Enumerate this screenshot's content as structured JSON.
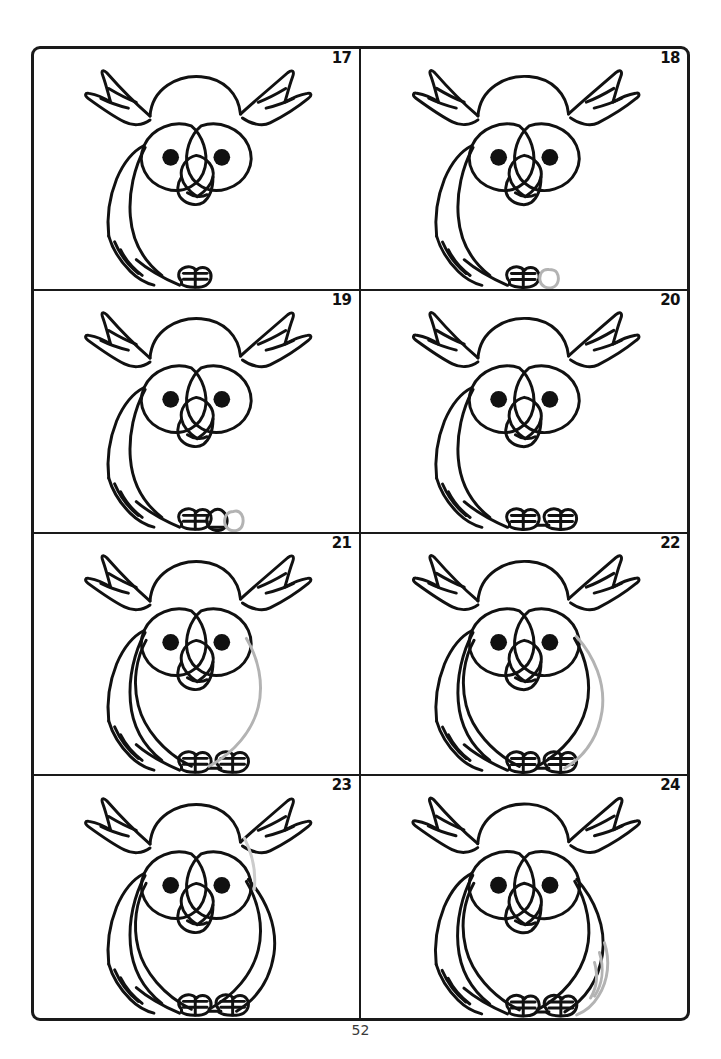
{
  "page": {
    "page_number": "52",
    "sheet_border_color": "#1a1a1a",
    "background_color": "#ffffff",
    "ink_color": "#111111",
    "new_stroke_color": "#b3b3b3"
  },
  "panels": [
    {
      "number": "17",
      "caption": "Owl head with ear tufts, eye discs, pupils, beak, left wing sweep and one toe - all in black ink",
      "new_stroke": "none",
      "features": {
        "head": true,
        "ear_tufts": true,
        "eye_discs": true,
        "pupils": true,
        "beak": true,
        "left_wing": true,
        "left_foot": true,
        "right_foot": false,
        "body": false,
        "right_wing": false
      }
    },
    {
      "number": "18",
      "caption": "Second toe added as a new gray oval to the right of the first foot",
      "new_stroke": "right-foot-oval",
      "features": {
        "head": true,
        "ear_tufts": true,
        "eye_discs": true,
        "pupils": true,
        "beak": true,
        "left_wing": true,
        "left_foot": true,
        "right_foot": "gray",
        "body": false,
        "right_wing": false
      }
    },
    {
      "number": "19",
      "caption": "Second toe inked in black, a further gray oval sketched beside it",
      "new_stroke": "second-toe-oval",
      "features": {
        "head": true,
        "ear_tufts": true,
        "eye_discs": true,
        "pupils": true,
        "beak": true,
        "left_wing": true,
        "left_foot": true,
        "right_foot": "black-partial",
        "body": false,
        "right_wing": false
      }
    },
    {
      "number": "20",
      "caption": "Both feet complete in black with toe divisions drawn",
      "new_stroke": "feet-detail",
      "features": {
        "head": true,
        "ear_tufts": true,
        "eye_discs": true,
        "pupils": true,
        "beak": true,
        "left_wing": true,
        "left_foot": true,
        "right_foot": "black",
        "body": false,
        "right_wing": false
      }
    },
    {
      "number": "21",
      "caption": "Body silhouette started - left half black, right half sketched in gray",
      "new_stroke": "body-right-curve",
      "features": {
        "head": true,
        "ear_tufts": true,
        "eye_discs": true,
        "pupils": true,
        "beak": true,
        "left_wing": true,
        "left_foot": true,
        "right_foot": "black",
        "body": "half",
        "right_wing": false
      }
    },
    {
      "number": "22",
      "caption": "Body outline closed in black; gray guide line marks the right wing edge",
      "new_stroke": "right-wing-guide",
      "features": {
        "head": true,
        "ear_tufts": true,
        "eye_discs": true,
        "pupils": true,
        "beak": true,
        "left_wing": true,
        "left_foot": true,
        "right_foot": "black",
        "body": true,
        "right_wing": "gray"
      }
    },
    {
      "number": "23",
      "caption": "Right wing inked in black; a faint gray stroke hints at the wing's inner line",
      "new_stroke": "right-wing-inner",
      "features": {
        "head": true,
        "ear_tufts": true,
        "eye_discs": true,
        "pupils": true,
        "beak": true,
        "left_wing": true,
        "left_foot": true,
        "right_foot": "black",
        "body": true,
        "right_wing": "black"
      }
    },
    {
      "number": "24",
      "caption": "Finished owl; gray strokes show the last right wing-tip feathers being added",
      "new_stroke": "right-wing-tip-feathers",
      "features": {
        "head": true,
        "ear_tufts": true,
        "eye_discs": true,
        "pupils": true,
        "beak": true,
        "left_wing": true,
        "left_foot": true,
        "right_foot": "black",
        "body": true,
        "right_wing": "complete"
      }
    }
  ]
}
